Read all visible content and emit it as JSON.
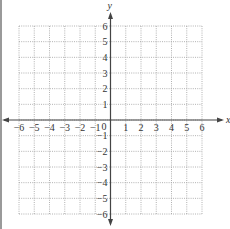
{
  "diagram": {
    "type": "coordinate-plane",
    "x_axis": {
      "label": "x",
      "min": -6,
      "max": 6,
      "ticks": [
        "-6",
        "-5",
        "-4",
        "-3",
        "-2",
        "-1",
        "1",
        "2",
        "3",
        "4",
        "5",
        "6"
      ]
    },
    "y_axis": {
      "label": "y",
      "min": -6,
      "max": 6,
      "ticks": [
        "6",
        "5",
        "4",
        "3",
        "2",
        "1",
        "-1",
        "-2",
        "-3",
        "-4",
        "-5",
        "-6"
      ]
    },
    "origin_label": "0",
    "grid": {
      "style": "dotted",
      "cells_x": 12,
      "cells_y": 12,
      "color": "#9e9e9e"
    },
    "axis_color": "#444444"
  }
}
